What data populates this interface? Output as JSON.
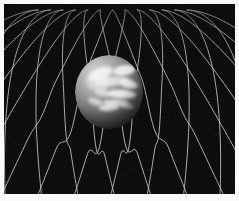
{
  "figure": {
    "title": "Spacetime curvature around a massive body",
    "subject": "planet resting in a gravity well on a deformed grid",
    "alt_text": "A grey cloud-banded planet sits in a funnel-shaped depression of a white wireframe grid on a black background",
    "background_color": "#050505",
    "border_color": "#fbfbfb",
    "grid_color": "#d8d8d8",
    "accent_color": "#ffffff",
    "width": 239,
    "height": 201
  },
  "scene": {
    "frame": {
      "x": 4,
      "y": 4,
      "width": 231,
      "height": 190
    },
    "grid": {
      "label": "spacetime-grid",
      "line_color": "#cfcfcf",
      "line_width": 0.9,
      "opacity": 0.85,
      "u_lines": 13,
      "v_lines": 13,
      "horizon_y": 6,
      "perspective_strength": 0.62,
      "well": {
        "label": "gravity-well",
        "center_x": 106,
        "center_y": 112,
        "radius": 96,
        "depth": 34
      }
    },
    "planet": {
      "label": "planet-sphere",
      "center_x": 105,
      "center_y": 88,
      "radius_x": 34,
      "radius_y": 37,
      "light_direction": "upper-left",
      "base_color": "#8e8e8e",
      "highlight_color": "#e8e8e8",
      "shadow_color": "#0b0b0b",
      "texture": "cloud-bands",
      "texture_patches": [
        {
          "cx": 30,
          "cy": 22,
          "rx": 15,
          "ry": 7,
          "rot": -22,
          "v": 0.82
        },
        {
          "cx": 58,
          "cy": 18,
          "rx": 13,
          "ry": 6,
          "rot": -8,
          "v": 0.95
        },
        {
          "cx": 44,
          "cy": 31,
          "rx": 20,
          "ry": 5,
          "rot": -6,
          "v": 0.7
        },
        {
          "cx": 63,
          "cy": 34,
          "rx": 11,
          "ry": 5,
          "rot": 14,
          "v": 0.88
        },
        {
          "cx": 33,
          "cy": 45,
          "rx": 10,
          "ry": 4,
          "rot": 10,
          "v": 0.55
        },
        {
          "cx": 55,
          "cy": 46,
          "rx": 17,
          "ry": 5,
          "rot": 4,
          "v": 0.92
        },
        {
          "cx": 24,
          "cy": 55,
          "rx": 9,
          "ry": 4,
          "rot": 18,
          "v": 0.66
        },
        {
          "cx": 48,
          "cy": 56,
          "rx": 15,
          "ry": 4,
          "rot": 2,
          "v": 0.78
        },
        {
          "cx": 40,
          "cy": 62,
          "rx": 12,
          "ry": 4,
          "rot": -4,
          "v": 0.86
        },
        {
          "cx": 60,
          "cy": 60,
          "rx": 9,
          "ry": 3,
          "rot": 8,
          "v": 0.62
        },
        {
          "cx": 31,
          "cy": 38,
          "rx": 7,
          "ry": 7,
          "rot": 0,
          "v": 0.4
        },
        {
          "cx": 20,
          "cy": 33,
          "rx": 6,
          "ry": 9,
          "rot": -30,
          "v": 0.34
        }
      ],
      "dark_patches": [
        {
          "cx": 28,
          "cy": 26,
          "rx": 10,
          "ry": 7,
          "rot": -18,
          "v": 0.55
        },
        {
          "cx": 38,
          "cy": 36,
          "rx": 9,
          "ry": 6,
          "rot": 12,
          "v": 0.48
        },
        {
          "cx": 22,
          "cy": 45,
          "rx": 7,
          "ry": 6,
          "rot": 0,
          "v": 0.4
        },
        {
          "cx": 52,
          "cy": 24,
          "rx": 6,
          "ry": 4,
          "rot": 20,
          "v": 0.35
        }
      ]
    }
  },
  "legend": {
    "visible": false,
    "entries": []
  },
  "annotations": {
    "visible": false,
    "items": []
  }
}
